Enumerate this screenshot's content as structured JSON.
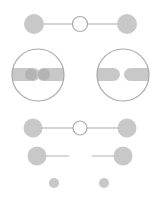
{
  "canvas": {
    "width": 158,
    "height": 200,
    "background": "#ffffff"
  },
  "colors": {
    "fill": "#c8c8c8",
    "dot": "#b4b4b4",
    "stroke": "#a9a9a9",
    "line": "#c4c4c4"
  },
  "rows": [
    {
      "name": "connected-row",
      "left_node": {
        "cx": 34,
        "cy": 24,
        "r": 10
      },
      "center_node": {
        "cx": 80,
        "cy": 24,
        "r": 7.5,
        "hollow": true
      },
      "right_node": {
        "cx": 127,
        "cy": 24,
        "r": 10
      },
      "line": {
        "x1": 34,
        "x2": 127,
        "y": 24
      }
    },
    {
      "name": "magnified-plugs",
      "lenses": [
        {
          "cx": 38,
          "cy": 75,
          "r": 26,
          "state": "connected",
          "pills": [
            {
              "x": 12,
              "y": 68,
              "w": 26,
              "h": 13,
              "round": "right"
            },
            {
              "x": 38,
              "y": 68,
              "w": 26,
              "h": 13,
              "round": "left"
            }
          ],
          "dots": [
            {
              "cx": 31,
              "cy": 74.5,
              "r": 6
            },
            {
              "cx": 44,
              "cy": 74.5,
              "r": 6
            }
          ]
        },
        {
          "cx": 123,
          "cy": 75,
          "r": 26,
          "state": "disconnected",
          "pills": [
            {
              "x": 97,
              "y": 68,
              "w": 23,
              "h": 13,
              "round": "right"
            },
            {
              "x": 124,
              "y": 68,
              "w": 26,
              "h": 13,
              "round": "left"
            }
          ],
          "dots": []
        }
      ]
    },
    {
      "name": "connected-row-2",
      "left_node": {
        "cx": 33,
        "cy": 128,
        "r": 9.5
      },
      "center_node": {
        "cx": 80,
        "cy": 128,
        "r": 7,
        "hollow": true
      },
      "right_node": {
        "cx": 127,
        "cy": 128,
        "r": 9.5
      },
      "line": {
        "x1": 33,
        "x2": 127,
        "y": 128
      }
    },
    {
      "name": "disconnected-row",
      "left_node": {
        "cx": 37,
        "cy": 156,
        "r": 9.5
      },
      "right_node": {
        "cx": 123,
        "cy": 156,
        "r": 9.5
      },
      "left_line": {
        "x1": 37,
        "x2": 69,
        "y": 156
      },
      "right_line": {
        "x1": 92,
        "x2": 123,
        "y": 156
      }
    },
    {
      "name": "small-dots-row",
      "dots": [
        {
          "cx": 54,
          "cy": 183,
          "r": 5
        },
        {
          "cx": 104,
          "cy": 183,
          "r": 5
        }
      ]
    }
  ]
}
